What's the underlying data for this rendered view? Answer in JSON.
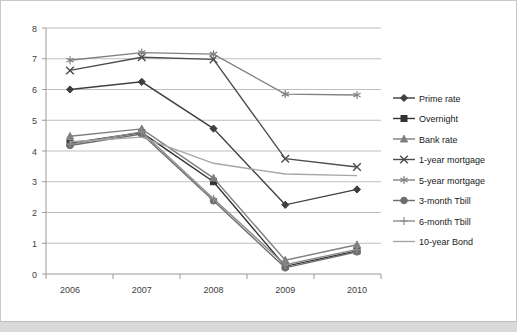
{
  "chart_data": {
    "type": "line",
    "title": "",
    "xlabel": "",
    "ylabel": "",
    "categories": [
      "2006",
      "2007",
      "2008",
      "2009",
      "2010"
    ],
    "ylim": [
      0,
      8
    ],
    "ytick_step": 1,
    "yticks": [
      "0",
      "1",
      "2",
      "3",
      "4",
      "5",
      "6",
      "7",
      "8"
    ],
    "grid": true,
    "legend_position": "right",
    "series": [
      {
        "name": "Prime rate",
        "marker": "diamond",
        "color": "#3f3f3f",
        "values": [
          6.0,
          6.25,
          4.73,
          2.25,
          2.75
        ]
      },
      {
        "name": "Overnight",
        "marker": "square",
        "color": "#333333",
        "values": [
          4.25,
          4.6,
          3.0,
          0.25,
          0.75
        ]
      },
      {
        "name": "Bank rate",
        "marker": "triangle",
        "color": "#7f7f7f",
        "values": [
          4.48,
          4.72,
          3.12,
          0.45,
          0.95
        ]
      },
      {
        "name": "1-year mortgage",
        "marker": "cross",
        "color": "#4d4d4d",
        "values": [
          6.62,
          7.05,
          6.98,
          3.75,
          3.48
        ]
      },
      {
        "name": "5-year mortgage",
        "marker": "star",
        "color": "#808080",
        "values": [
          6.95,
          7.2,
          7.15,
          5.85,
          5.82
        ]
      },
      {
        "name": "3-month Tbill",
        "marker": "circle",
        "color": "#6e6e6e",
        "values": [
          4.18,
          4.55,
          2.38,
          0.2,
          0.72
        ]
      },
      {
        "name": "6-month Tbill",
        "marker": "plus",
        "color": "#8c8c8c",
        "values": [
          4.22,
          4.62,
          2.45,
          0.3,
          0.8
        ]
      },
      {
        "name": "10-year Bond",
        "marker": "none",
        "color": "#a6a6a6",
        "values": [
          4.3,
          4.45,
          3.6,
          3.25,
          3.2
        ]
      }
    ]
  }
}
